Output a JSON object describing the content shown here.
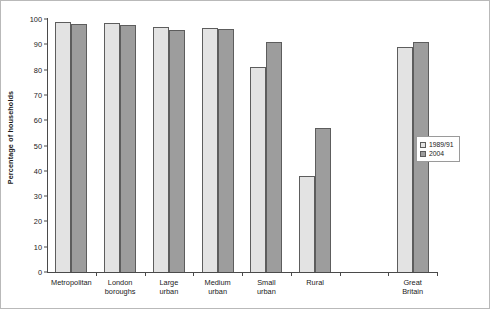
{
  "chart_data": {
    "type": "bar",
    "title": "",
    "xlabel": "",
    "ylabel": "Percentage of households",
    "ylim": [
      0,
      100
    ],
    "ytick_labels": [
      "0",
      "10",
      "20",
      "30",
      "40",
      "50",
      "60",
      "70",
      "80",
      "90",
      "100"
    ],
    "ytick_values": [
      0,
      10,
      20,
      30,
      40,
      50,
      60,
      70,
      80,
      90,
      100
    ],
    "grid": false,
    "legend_position": "right",
    "categories": [
      "Metropolitan",
      "London\nboroughs",
      "Large\nurban",
      "Medium\nurban",
      "Small\nurban",
      "Rural",
      "",
      "Great\nBritain"
    ],
    "series": [
      {
        "name": "1989/91",
        "color": "#e3e3e3",
        "values": [
          99,
          98.5,
          97,
          96.5,
          81,
          38,
          null,
          89
        ]
      },
      {
        "name": "2004",
        "color": "#9d9d9d",
        "values": [
          98,
          97.5,
          95.5,
          96,
          91,
          57,
          null,
          91
        ]
      }
    ]
  },
  "legend": {
    "items": [
      {
        "label": "1989/91"
      },
      {
        "label": "2004"
      }
    ]
  }
}
